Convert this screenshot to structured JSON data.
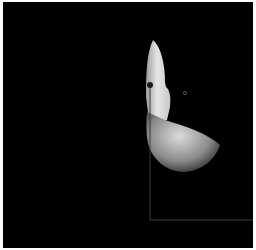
{
  "scene": {
    "description": "Dark render with a light-gradient silhouette shape, a marker dot on a vertical line, and an L-shaped axis line",
    "background_color": "#000000",
    "frame_color": "#ffffff",
    "shape_highlight_color": "#e8e8e8",
    "line_color": "#3a3a3a",
    "marker_color": "#1a1a1a"
  }
}
